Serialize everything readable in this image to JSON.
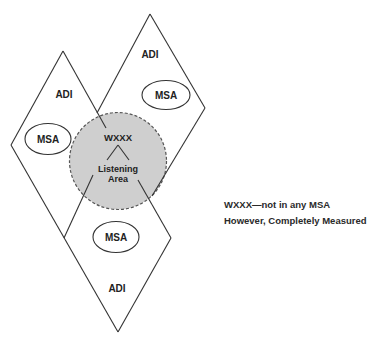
{
  "diagram": {
    "regions": [
      {
        "id": "adi-left",
        "label": "ADI"
      },
      {
        "id": "adi-right",
        "label": "ADI"
      },
      {
        "id": "adi-bottom",
        "label": "ADI"
      }
    ],
    "msa_ovals": [
      {
        "id": "msa-left",
        "label": "MSA"
      },
      {
        "id": "msa-right",
        "label": "MSA"
      },
      {
        "id": "msa-bottom",
        "label": "MSA"
      }
    ],
    "station": {
      "call_sign": "WXXX",
      "area_line1": "Listening",
      "area_line2": "Area",
      "fill_color": "#cfcfcf",
      "outline_style": "dashed"
    },
    "notes": {
      "line1": "WXXX—not in any MSA",
      "line2": "However, Completely Measured"
    },
    "colors": {
      "line": "#333333",
      "circle_fill": "#cfcfcf",
      "background": "#ffffff"
    }
  }
}
